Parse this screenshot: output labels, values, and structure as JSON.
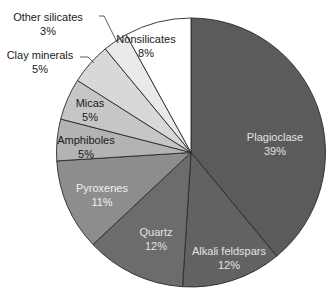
{
  "chart_data": {
    "type": "pie",
    "title": "",
    "start_angle_deg": 0,
    "direction": "clockwise",
    "center": [
      191,
      152.5
    ],
    "radius": 134.5,
    "slices": [
      {
        "label": "Plagioclase",
        "value": 39,
        "value_label": "39%",
        "color": "#5b5b5b",
        "text_color": "#e2e2e2",
        "label_pos": [
          275,
          137
        ],
        "outside": false
      },
      {
        "label": "Alkali feldspars",
        "value": 12,
        "value_label": "12%",
        "color": "#626262",
        "text_color": "#e2e2e2",
        "label_pos": [
          229,
          251
        ],
        "outside": false
      },
      {
        "label": "Quartz",
        "value": 12,
        "value_label": "12%",
        "color": "#6c6c6c",
        "text_color": "#e2e2e2",
        "label_pos": [
          156,
          232
        ],
        "outside": false
      },
      {
        "label": "Pyroxenes",
        "value": 11,
        "value_label": "11%",
        "color": "#8d8d8d",
        "text_color": "#f0f0f0",
        "label_pos": [
          102,
          188
        ],
        "outside": false
      },
      {
        "label": "Amphiboles",
        "value": 5,
        "value_label": "5%",
        "color": "#b3b3b3",
        "text_color": "#1a1a1a",
        "label_pos": [
          86,
          140
        ],
        "outside": false
      },
      {
        "label": "Micas",
        "value": 5,
        "value_label": "5%",
        "color": "#c6c6c6",
        "text_color": "#1a1a1a",
        "label_pos": [
          90,
          103
        ],
        "outside": false
      },
      {
        "label": "Clay minerals",
        "value": 5,
        "value_label": "5%",
        "color": "#d8d8d8",
        "text_color": "#1a1a1a",
        "label_pos": [
          40,
          55
        ],
        "outside": true,
        "leader": [
          [
            80,
            57
          ],
          [
            88,
            57
          ],
          [
            94,
            63
          ]
        ]
      },
      {
        "label": "Other silicates",
        "value": 3,
        "value_label": "3%",
        "color": "#eaeaea",
        "text_color": "#1a1a1a",
        "label_pos": [
          48,
          17
        ],
        "outside": true,
        "leader": [
          [
            99,
            16
          ],
          [
            104,
            16
          ],
          [
            117,
            42
          ]
        ]
      },
      {
        "label": "Nonsilicates",
        "value": 8,
        "value_label": "8%",
        "color": "#ffffff",
        "text_color": "#1a1a1a",
        "label_pos": [
          146,
          39
        ],
        "outside": false
      }
    ],
    "legend": "none",
    "grid": false
  }
}
